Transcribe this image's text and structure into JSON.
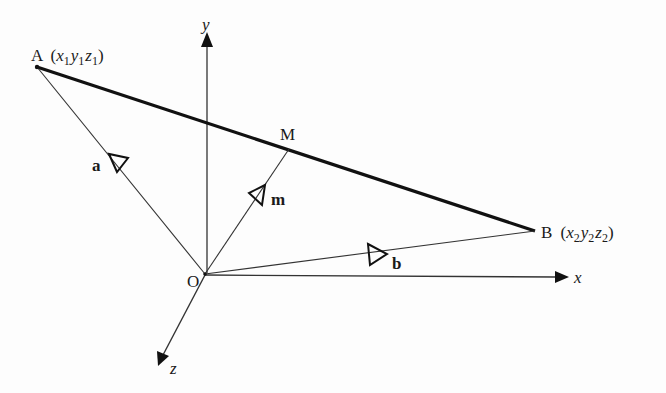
{
  "diagram": {
    "title": "",
    "colors": {
      "line": "#222222",
      "thick_line": "#111111",
      "background": "#fdfdfd"
    },
    "origin": {
      "label": "O"
    },
    "axes": [
      {
        "id": "x",
        "label": "x"
      },
      {
        "id": "y",
        "label": "y"
      },
      {
        "id": "z",
        "label": "z"
      }
    ],
    "points": {
      "A": {
        "label": "A",
        "coords": [
          "x",
          "1",
          "y",
          "1",
          "z",
          "1"
        ]
      },
      "B": {
        "label": "B",
        "coords": [
          "x",
          "2",
          "y",
          "2",
          "z",
          "2"
        ]
      },
      "M": {
        "label": "M"
      }
    },
    "vectors": {
      "a": {
        "label": "a",
        "from": "O",
        "to": "A"
      },
      "b": {
        "label": "b",
        "from": "O",
        "to": "B"
      },
      "m": {
        "label": "m",
        "from": "O",
        "to": "M"
      }
    },
    "segment": {
      "from": "A",
      "to": "B",
      "style": "thick"
    }
  }
}
